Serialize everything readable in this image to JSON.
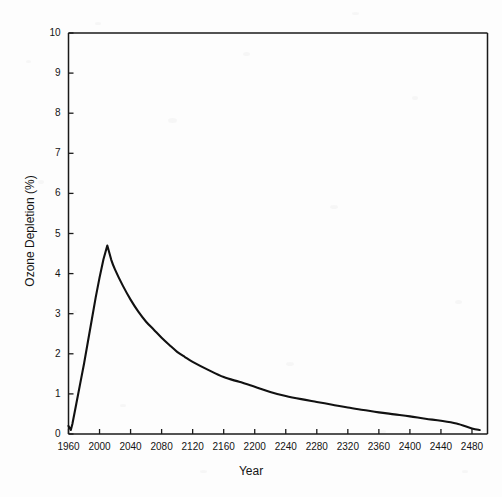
{
  "chart_data": {
    "type": "line",
    "title": "",
    "xlabel": "Year",
    "ylabel": "Ozone Depletion (%)",
    "xlim": [
      1960,
      2500
    ],
    "ylim": [
      0,
      10
    ],
    "grid": false,
    "legend": null,
    "x_ticks": [
      1960,
      2000,
      2040,
      2080,
      2120,
      2160,
      2200,
      2240,
      2280,
      2320,
      2360,
      2400,
      2440,
      2480
    ],
    "y_ticks": [
      0,
      1,
      2,
      3,
      4,
      5,
      6,
      7,
      8,
      9,
      10
    ],
    "series": [
      {
        "name": "Ozone Depletion",
        "color": "#111111",
        "x": [
          1960,
          1963,
          1965,
          1970,
          1975,
          1980,
          1985,
          1990,
          1995,
          2000,
          2005,
          2010,
          2015,
          2020,
          2030,
          2040,
          2050,
          2060,
          2070,
          2080,
          2090,
          2100,
          2110,
          2120,
          2140,
          2160,
          2180,
          2200,
          2220,
          2240,
          2260,
          2280,
          2300,
          2320,
          2340,
          2360,
          2380,
          2400,
          2420,
          2440,
          2460,
          2480,
          2490
        ],
        "y": [
          0.2,
          0.1,
          0.25,
          0.75,
          1.25,
          1.75,
          2.3,
          2.85,
          3.4,
          3.9,
          4.35,
          4.7,
          4.35,
          4.1,
          3.7,
          3.35,
          3.05,
          2.8,
          2.6,
          2.4,
          2.22,
          2.05,
          1.92,
          1.8,
          1.6,
          1.42,
          1.3,
          1.18,
          1.05,
          0.95,
          0.87,
          0.8,
          0.73,
          0.66,
          0.6,
          0.54,
          0.49,
          0.44,
          0.38,
          0.33,
          0.26,
          0.14,
          0.1
        ]
      }
    ]
  },
  "axes": {
    "x_tick_labels": [
      "1960",
      "2000",
      "2040",
      "2080",
      "2120",
      "2160",
      "2200",
      "2240",
      "2280",
      "2320",
      "2360",
      "2400",
      "2440",
      "2480"
    ],
    "y_tick_labels": [
      "0",
      "1",
      "2",
      "3",
      "4",
      "5",
      "6",
      "7",
      "8",
      "9",
      "10"
    ],
    "x_axis_title": "Year",
    "y_axis_title": "Ozone Depletion (%)"
  },
  "style": {
    "line_color": "#111111",
    "axis_color": "#1a1a1a",
    "background": "#fdfdfd"
  }
}
